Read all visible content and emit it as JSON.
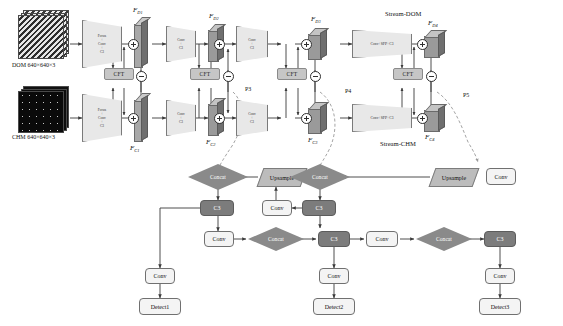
{
  "figure": {
    "type": "diagram"
  },
  "inputs": [
    {
      "id": "dom",
      "caption": "DOM 640×640×3",
      "texture": "diagonal-stripe",
      "tone": "light"
    },
    {
      "id": "chm",
      "caption": "CHM 640×640×3",
      "texture": "dotted-dark",
      "tone": "dark"
    }
  ],
  "stem_blocks": [
    {
      "id": "stem-dom",
      "lines": [
        "Focus",
        "+",
        "Conv",
        "+",
        "C3"
      ]
    },
    {
      "id": "stem-chm",
      "lines": [
        "Focus",
        "+",
        "Conv",
        "+",
        "C3"
      ]
    }
  ],
  "backbone_blocks": [
    {
      "id": "dom-conv-c3-1",
      "lines": [
        "Conv",
        "+",
        "C3"
      ]
    },
    {
      "id": "dom-conv-c3-2",
      "lines": [
        "Conv",
        "+",
        "C3"
      ]
    },
    {
      "id": "dom-spp",
      "lines": [
        "Conv+SPP+C3"
      ]
    },
    {
      "id": "chm-conv-c3-1",
      "lines": [
        "Conv",
        "+",
        "C3"
      ]
    },
    {
      "id": "chm-conv-c3-2",
      "lines": [
        "Conv",
        "+",
        "C3"
      ]
    },
    {
      "id": "chm-spp",
      "lines": [
        "Conv+SPP+C3"
      ]
    }
  ],
  "fusion": {
    "label": "CFT",
    "count": 4,
    "add_op": "⊕",
    "sub_op": "⊖"
  },
  "feature_labels": {
    "dom": [
      "F",
      "F",
      "F",
      "F"
    ],
    "dom_sub": [
      "D1",
      "D2",
      "D3",
      "D4"
    ],
    "chm": [
      "F",
      "F",
      "F",
      "F"
    ],
    "chm_sub": [
      "C1",
      "C2",
      "C3",
      "C4"
    ]
  },
  "streams": {
    "top": "Stream-DOM",
    "bottom": "Stream-CHM"
  },
  "pyramid_taps": [
    "P3",
    "P4",
    "P5"
  ],
  "neck": {
    "concat": "Concat",
    "upsample": "Upsample",
    "c3": "C3",
    "conv": "Conv"
  },
  "heads": [
    "Detect1",
    "Detect2",
    "Detect3"
  ],
  "colors": {
    "trapezoid_fill": "#e8e8e8",
    "cft_fill": "#c6c6c6",
    "c3_fill": "#7c7c7c",
    "concat_fill": "#8a8a8a",
    "upsample_fill": "#bcbcbc",
    "conv_fill": "#f4f4f4",
    "stroke": "#6a6a6a",
    "wire": "#4a4a4a",
    "dashed": "#9a9a9a"
  }
}
